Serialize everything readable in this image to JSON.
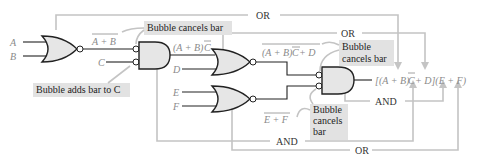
{
  "inputs": {
    "a": "A",
    "b": "B",
    "c": "C",
    "d": "D",
    "e": "E",
    "f": "F"
  },
  "expressions": {
    "nor1_out": "A + B",
    "and1_out_prefix": "(A + B)",
    "and1_out_bar": "C",
    "nor2_out_prefix": "(A + B)",
    "nor2_out_bar": "C",
    "nor2_out_suffix": " + D",
    "nor3_out": "E + F",
    "final_part1": "[(A + B)",
    "final_bar": "C",
    "final_part2": " + D](E + F)"
  },
  "notes": {
    "bubble_cancels_1": "Bubble cancels bar",
    "bubble_adds": "Bubble adds bar to C",
    "bubble_cancels_2_line1": "Bubble",
    "bubble_cancels_2_line2": "cancels bar",
    "bubble_cancels_3_line1": "Bubble",
    "bubble_cancels_3_line2": "cancels",
    "bubble_cancels_3_line3": "bar"
  },
  "equivalences": {
    "top_or": "OR",
    "mid_or": "OR",
    "right_and": "AND",
    "bottom_and": "AND",
    "bottom_or": "OR"
  },
  "colors": {
    "gate_fill": "#e6e6e6",
    "annotation_gray": "#c4c4c4",
    "note_bg": "#e2e2e2"
  }
}
